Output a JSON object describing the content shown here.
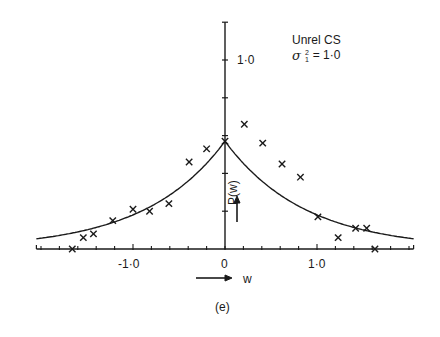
{
  "figure": {
    "caption": "(e)",
    "legend": {
      "line1": "Unrel CS",
      "sigma_symbol": "σ",
      "sup": "2",
      "sub": "1",
      "eq": "= 1·0"
    },
    "x_axis_label": "w",
    "y_axis_label": "P(w)",
    "x_tick_labels": [
      "-1·0",
      "0",
      "1·0"
    ],
    "y_tick_labels": [
      "1·0"
    ],
    "colors": {
      "ink": "#1a1a1a",
      "background": "#ffffff"
    }
  },
  "chart_data": {
    "type": "scatter",
    "subtitle": "(e)",
    "xlabel": "w",
    "ylabel": "P(w)",
    "xlim": [
      -2.05,
      2.05
    ],
    "ylim": [
      0,
      1.2
    ],
    "x_ticks": [
      -2.0,
      -1.8,
      -1.6,
      -1.4,
      -1.2,
      -1.0,
      -0.8,
      -0.6,
      -0.4,
      -0.2,
      0,
      0.2,
      0.4,
      0.6,
      0.8,
      1.0,
      1.2,
      1.4,
      1.6,
      1.8,
      2.0
    ],
    "x_tick_labels": {
      "-1.0": "-1·0",
      "0": "0",
      "1.0": "1·0"
    },
    "y_ticks": [
      0.2,
      0.4,
      0.6,
      0.8,
      1.0,
      1.2
    ],
    "y_tick_labels": {
      "1.0": "1·0"
    },
    "grid": false,
    "legend_position": "top-right",
    "series": [
      {
        "name": "simulated (x markers)",
        "marker": "x",
        "x": [
          -1.66,
          -1.54,
          -1.43,
          -1.22,
          -1.0,
          -0.82,
          -0.61,
          -0.39,
          -0.2,
          0.0,
          0.21,
          0.41,
          0.62,
          0.82,
          1.01,
          1.23,
          1.42,
          1.54,
          1.63
        ],
        "y": [
          0.0,
          0.06,
          0.08,
          0.15,
          0.21,
          0.2,
          0.24,
          0.46,
          0.53,
          0.57,
          0.66,
          0.56,
          0.45,
          0.38,
          0.17,
          0.06,
          0.11,
          0.11,
          0.0
        ]
      },
      {
        "name": "theoretical (solid line)",
        "type": "line",
        "formula": "P(w) = 0.57·exp(-1.15|w|)",
        "peak": 0.57,
        "decay": 1.15,
        "x_range": [
          -2.05,
          2.05
        ]
      }
    ]
  }
}
